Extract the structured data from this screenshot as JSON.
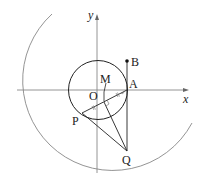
{
  "diagram": {
    "type": "geometry",
    "axes": {
      "x_label": "x",
      "y_label": "y",
      "origin_label": "O"
    },
    "points": {
      "A": {
        "label": "A"
      },
      "B": {
        "label": "B"
      },
      "M": {
        "label": "M"
      },
      "P": {
        "label": "P"
      },
      "Q": {
        "label": "Q"
      }
    },
    "shapes": [
      "unit circle centered at O passing through A",
      "large circle arc centered at B passing through Q",
      "segment BQ (vertical through A)",
      "segment PA",
      "segment PQ",
      "segment QM",
      "segment OM"
    ],
    "marks": [
      "right angle at M",
      "equal tick marks on PM and MA"
    ],
    "colors": {
      "stroke": "#222222",
      "axis": "#888888",
      "arc": "#888888"
    }
  }
}
